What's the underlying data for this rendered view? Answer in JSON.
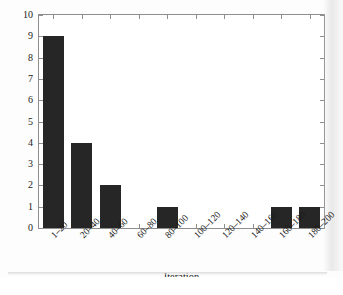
{
  "chart_data": {
    "type": "bar",
    "title": "",
    "subtitle": "",
    "xlabel": "Iteration",
    "ylabel": "Random perturbation",
    "categories": [
      "1–20",
      "20–40",
      "40–60",
      "60–80",
      "80–100",
      "100–120",
      "120–140",
      "140–160",
      "160–180",
      "180–200"
    ],
    "values": [
      9,
      4,
      2,
      0,
      1,
      0,
      0,
      0,
      1,
      1
    ],
    "ylim": [
      0,
      10
    ],
    "yticks": [
      0,
      1,
      2,
      3,
      4,
      5,
      6,
      7,
      8,
      9,
      10
    ],
    "ytick_labels": [
      "0",
      "1",
      "2",
      "3",
      "4",
      "5",
      "6",
      "7",
      "8",
      "9",
      "10"
    ],
    "grid": false,
    "legend": null,
    "bar_color": "#262626",
    "axis_color": "#8e8e8e",
    "annotations": []
  }
}
